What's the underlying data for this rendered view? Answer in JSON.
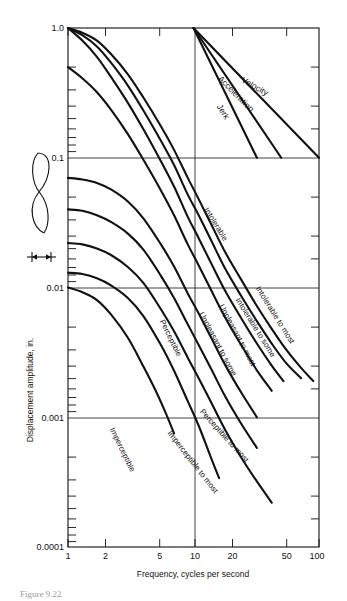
{
  "figure": {
    "caption": "Figure 9.22",
    "top_faint_text": ""
  },
  "axes": {
    "x": {
      "title": "Frequency, cycles per second",
      "ticks": [
        "1",
        "2",
        "5",
        "10",
        "20",
        "50",
        "100"
      ],
      "tick_values": [
        1,
        2,
        5,
        10,
        20,
        50,
        100
      ],
      "scale": "log",
      "range": [
        1,
        100
      ]
    },
    "y": {
      "title": "Displacement amplitude, in.",
      "ticks": [
        "1.0",
        "0.1",
        "0.01",
        "0.001",
        "0.0001"
      ],
      "tick_values": [
        1.0,
        0.1,
        0.01,
        0.001,
        0.0001
      ],
      "scale": "log",
      "range": [
        0.0001,
        1.0
      ]
    }
  },
  "inset": {
    "name": "amplitude-waveform-inset",
    "arrow_label": ""
  },
  "chart_data": {
    "type": "line",
    "title": "",
    "xlabel": "Frequency, cycles per second",
    "ylabel": "Displacement amplitude, in.",
    "xscale": "log",
    "yscale": "log",
    "xlim": [
      1,
      100
    ],
    "ylim": [
      0.0001,
      1.0
    ],
    "grid": "major-log-lines",
    "legend": "inline-curve-labels",
    "reference_lines": [
      {
        "name": "Velocity",
        "label": "Velocity",
        "points": [
          [
            10,
            1.0
          ],
          [
            100,
            0.1
          ]
        ],
        "label_pos": [
          30,
          0.34
        ]
      },
      {
        "name": "Acceleration",
        "label": "Acceleration",
        "points": [
          [
            10,
            1.0
          ],
          [
            50,
            0.1
          ]
        ],
        "label_pos": [
          21,
          0.3
        ]
      },
      {
        "name": "Jerk",
        "label": "Jerk",
        "points": [
          [
            10,
            1.0
          ],
          [
            32,
            0.1
          ]
        ],
        "label_pos": [
          16.5,
          0.22
        ]
      }
    ],
    "series": [
      {
        "name": "Intolerable",
        "label": "Intolerable",
        "label_pos": [
          14.5,
          0.03
        ],
        "x": [
          1.0,
          1.3,
          1.7,
          2.2,
          3.0,
          4.0,
          5.5,
          7.0,
          9.0,
          11,
          14,
          18,
          24,
          32,
          42,
          55,
          72,
          90
        ],
        "y": [
          1.0,
          0.92,
          0.8,
          0.63,
          0.44,
          0.29,
          0.175,
          0.115,
          0.07,
          0.048,
          0.03,
          0.0185,
          0.0115,
          0.0072,
          0.0048,
          0.0033,
          0.0024,
          0.0019
        ]
      },
      {
        "name": "Intolerable to most",
        "label": "Intolerable to most",
        "label_pos": [
          43,
          0.006
        ],
        "x": [
          1.0,
          1.3,
          1.7,
          2.2,
          3.0,
          4.0,
          5.5,
          7.0,
          9.0,
          11,
          14,
          18,
          24,
          32,
          42,
          55,
          72
        ],
        "y": [
          1.0,
          0.88,
          0.72,
          0.54,
          0.36,
          0.23,
          0.135,
          0.088,
          0.052,
          0.036,
          0.0225,
          0.0138,
          0.0086,
          0.0055,
          0.0037,
          0.0026,
          0.002
        ]
      },
      {
        "name": "Intolerable to some",
        "label": "Intolerable to some",
        "label_pos": [
          30,
          0.0048
        ],
        "x": [
          1.0,
          1.3,
          1.7,
          2.2,
          3.0,
          4.0,
          5.5,
          7.0,
          9.0,
          11,
          14,
          18,
          24,
          32,
          42,
          52
        ],
        "y": [
          1.0,
          0.8,
          0.6,
          0.42,
          0.265,
          0.165,
          0.094,
          0.06,
          0.035,
          0.024,
          0.015,
          0.0093,
          0.0058,
          0.0037,
          0.0025,
          0.0019
        ]
      },
      {
        "name": "Unpleasant to most",
        "label": "Unpleasant to most",
        "label_pos": [
          21.5,
          0.0042
        ],
        "x": [
          1.0,
          1.3,
          1.7,
          2.2,
          3.0,
          4.0,
          5.5,
          7.0,
          9.0,
          11,
          14,
          18,
          24,
          32,
          42
        ],
        "y": [
          0.5,
          0.41,
          0.32,
          0.235,
          0.152,
          0.096,
          0.056,
          0.036,
          0.0215,
          0.0148,
          0.0093,
          0.0058,
          0.0036,
          0.0023,
          0.0016
        ]
      },
      {
        "name": "Unpleasant to some",
        "label": "Unpleasant to some",
        "label_pos": [
          15,
          0.0036
        ],
        "x": [
          1.0,
          1.3,
          1.7,
          2.2,
          3.0,
          4.0,
          5.5,
          7.0,
          9.0,
          11,
          14,
          18,
          24,
          32
        ],
        "y": [
          0.07,
          0.068,
          0.064,
          0.057,
          0.046,
          0.034,
          0.0215,
          0.0145,
          0.009,
          0.0063,
          0.004,
          0.0025,
          0.00155,
          0.001
        ]
      },
      {
        "name": "Perceptible",
        "label": "Perceptible",
        "label_pos": [
          6.3,
          0.004
        ],
        "x": [
          1.0,
          1.3,
          1.7,
          2.2,
          3.0,
          4.0,
          5.5,
          7.0,
          9.0,
          11,
          14,
          18,
          24,
          32
        ],
        "y": [
          0.04,
          0.039,
          0.036,
          0.032,
          0.026,
          0.0195,
          0.0123,
          0.0083,
          0.0052,
          0.0036,
          0.0023,
          0.00143,
          0.00089,
          0.00058
        ]
      },
      {
        "name": "Perceptible to most",
        "label": "Perceptible to most",
        "label_pos": [
          17,
          0.0007
        ],
        "x": [
          1.0,
          1.3,
          1.7,
          2.2,
          3.0,
          4.0,
          5.5,
          7.0,
          9.0,
          11,
          14,
          18,
          24,
          32,
          42
        ],
        "y": [
          0.022,
          0.0215,
          0.02,
          0.0178,
          0.0144,
          0.0108,
          0.0068,
          0.0046,
          0.00288,
          0.002,
          0.00127,
          0.00079,
          0.00049,
          0.00032,
          0.00022
        ]
      },
      {
        "name": "Imperceptible to most",
        "label": "Imperceptible to most",
        "label_pos": [
          9.5,
          0.00044
        ],
        "x": [
          1.0,
          1.3,
          1.7,
          2.2,
          3.0,
          4.0,
          5.5,
          7.0,
          9.0,
          11,
          14,
          16
        ],
        "y": [
          0.013,
          0.0127,
          0.0118,
          0.0104,
          0.0083,
          0.006,
          0.0036,
          0.00228,
          0.00133,
          0.00086,
          0.00047,
          0.00034
        ]
      },
      {
        "name": "Imperceptible",
        "label": "Imperceptible",
        "label_pos": [
          2.6,
          0.00055
        ],
        "x": [
          1.0,
          1.3,
          1.7,
          2.2,
          3.0,
          4.0,
          5.0,
          6.0,
          7.0
        ],
        "y": [
          0.01,
          0.0092,
          0.008,
          0.0062,
          0.0041,
          0.00245,
          0.0016,
          0.00108,
          0.00075
        ]
      }
    ]
  }
}
